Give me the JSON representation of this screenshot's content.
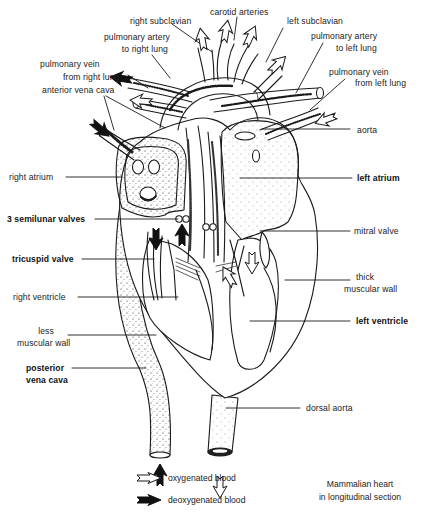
{
  "diagram": {
    "title": "Mammalian heart",
    "subtitle": "in longitudinal section",
    "colors": {
      "ink": "#1a1a1a",
      "background": "#ffffff",
      "oxygenated_arrow_fill": "#ffffff",
      "deoxygenated_arrow_fill": "#111111"
    },
    "labels": {
      "carotid_arteries": "carotid arteries",
      "right_subclavian": "right subclavian",
      "left_subclavian": "left subclavian",
      "pulmonary_artery_right_1": "pulmonary artery",
      "pulmonary_artery_right_2": "to right lung",
      "pulmonary_artery_left_1": "pulmonary artery",
      "pulmonary_artery_left_2": "to left lung",
      "pulmonary_vein_right_1": "pulmonary vein",
      "pulmonary_vein_right_2": "from right lung",
      "pulmonary_vein_left_1": "pulmonary vein",
      "pulmonary_vein_left_2": "from left lung",
      "anterior_vena_cava": "anterior vena cava",
      "aorta": "aorta",
      "right_atrium": "right atrium",
      "left_atrium": "left atrium",
      "semilunar_valves": "3 semilunar  valves",
      "mitral_valve": "mitral valve",
      "tricuspid_valve": "tricuspid valve",
      "thick_muscular_wall_1": "thick",
      "thick_muscular_wall_2": "muscular wall",
      "right_ventricle": "right ventricle",
      "left_ventricle": "left ventricle",
      "less_muscular_wall_1": "less",
      "less_muscular_wall_2": "muscular wall",
      "posterior_vena_cava_1": "posterior",
      "posterior_vena_cava_2": "vena cava",
      "dorsal_aorta": "dorsal aorta"
    },
    "legend": [
      {
        "icon": "open-arrow-icon",
        "label": "oxygenated blood"
      },
      {
        "icon": "filled-arrow-icon",
        "label": "deoxygenated blood"
      }
    ]
  }
}
